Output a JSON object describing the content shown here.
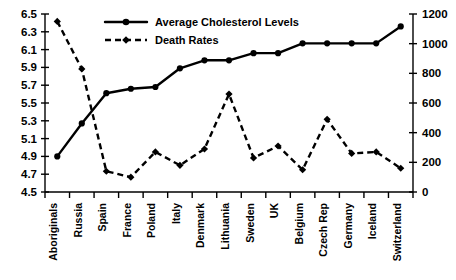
{
  "chart_data": {
    "type": "line",
    "title": "",
    "xlabel": "",
    "ylabel": "",
    "grid": false,
    "legend_position": "top-center",
    "categories": [
      "Aboriginals",
      "Russia",
      "Spain",
      "France",
      "Poland",
      "Italy",
      "Denmark",
      "Lithuania",
      "Sweden",
      "UK",
      "Belgium",
      "Czech Rep",
      "Germany",
      "Iceland",
      "Switzerland"
    ],
    "axes": {
      "left": {
        "label": "",
        "ylim": [
          4.5,
          6.5
        ],
        "ticks": [
          "4.5",
          "4.7",
          "4.9",
          "5.1",
          "5.3",
          "5.5",
          "5.7",
          "5.9",
          "6.1",
          "6.3",
          "6.5"
        ],
        "tick_values": [
          4.5,
          4.7,
          4.9,
          5.1,
          5.3,
          5.5,
          5.7,
          5.9,
          6.1,
          6.3,
          6.5
        ]
      },
      "right": {
        "label": "",
        "ylim": [
          0,
          1200
        ],
        "ticks": [
          "0",
          "200",
          "400",
          "600",
          "800",
          "1000",
          "1200"
        ],
        "tick_values": [
          0,
          200,
          400,
          600,
          800,
          1000,
          1200
        ]
      }
    },
    "series": [
      {
        "name": "Average Cholesterol Levels",
        "axis": "left",
        "style": "solid",
        "marker": "circle",
        "color": "#000000",
        "values": [
          4.9,
          5.27,
          5.61,
          5.66,
          5.68,
          5.89,
          5.98,
          5.98,
          6.06,
          6.06,
          6.17,
          6.17,
          6.17,
          6.17,
          6.36
        ]
      },
      {
        "name": "Death Rates",
        "axis": "right",
        "style": "dashed",
        "marker": "diamond",
        "color": "#000000",
        "values": [
          1150,
          830,
          140,
          100,
          270,
          180,
          290,
          660,
          230,
          310,
          150,
          490,
          260,
          270,
          160
        ]
      }
    ]
  },
  "legend": {
    "items": [
      {
        "label": "Average Cholesterol Levels",
        "style": "solid",
        "marker": "circle"
      },
      {
        "label": "Death Rates",
        "style": "dashed",
        "marker": "diamond"
      }
    ]
  }
}
